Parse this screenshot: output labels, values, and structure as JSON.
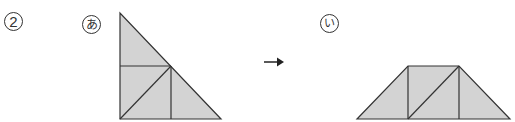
{
  "problem": {
    "number_label": "2"
  },
  "figures": [
    {
      "id": "a",
      "label": "あ",
      "shape": "right-triangle",
      "fill": "#d3d3d3",
      "stroke": "#333333",
      "pieces": "3 congruent isosceles right triangles + 1 square split along diagonal"
    },
    {
      "id": "i",
      "label": "い",
      "shape": "trapezoid",
      "fill": "#d3d3d3",
      "stroke": "#333333"
    }
  ],
  "arrow": {
    "direction": "right",
    "symbol": "→"
  },
  "colors": {
    "fill": "#d3d3d3",
    "stroke": "#333333",
    "background": "#ffffff"
  }
}
